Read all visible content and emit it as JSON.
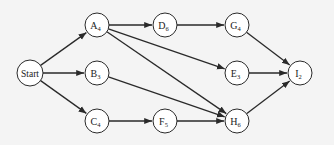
{
  "diagram": {
    "type": "network-activity-graph",
    "nodes": [
      {
        "id": "Start",
        "label": "Start",
        "sub": "",
        "x": 30,
        "y": 73
      },
      {
        "id": "A",
        "label": "A",
        "sub": "4",
        "x": 97,
        "y": 25
      },
      {
        "id": "B",
        "label": "B",
        "sub": "3",
        "x": 97,
        "y": 73
      },
      {
        "id": "C",
        "label": "C",
        "sub": "4",
        "x": 97,
        "y": 121
      },
      {
        "id": "D",
        "label": "D",
        "sub": "6",
        "x": 165,
        "y": 25
      },
      {
        "id": "F",
        "label": "F",
        "sub": "5",
        "x": 165,
        "y": 121
      },
      {
        "id": "G",
        "label": "G",
        "sub": "4",
        "x": 237,
        "y": 25
      },
      {
        "id": "E",
        "label": "E",
        "sub": "3",
        "x": 237,
        "y": 73
      },
      {
        "id": "H",
        "label": "H",
        "sub": "6",
        "x": 237,
        "y": 121
      },
      {
        "id": "I",
        "label": "I",
        "sub": "2",
        "x": 300,
        "y": 73
      }
    ],
    "edges": [
      [
        "Start",
        "A"
      ],
      [
        "Start",
        "B"
      ],
      [
        "Start",
        "C"
      ],
      [
        "A",
        "D"
      ],
      [
        "A",
        "E"
      ],
      [
        "A",
        "H"
      ],
      [
        "B",
        "H"
      ],
      [
        "C",
        "F"
      ],
      [
        "D",
        "G"
      ],
      [
        "F",
        "H"
      ],
      [
        "G",
        "I"
      ],
      [
        "E",
        "I"
      ],
      [
        "H",
        "I"
      ]
    ],
    "colors": {
      "stroke": "#2a2a2a",
      "fill": "#ffffff",
      "background": "#f4f4f4"
    }
  }
}
